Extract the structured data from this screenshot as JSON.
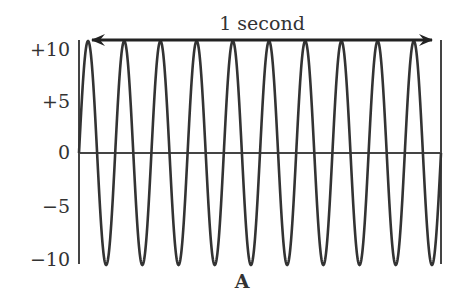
{
  "chart_data": {
    "type": "line",
    "title": "",
    "annotation": "1 second",
    "panel_label": "A",
    "xlabel": "",
    "ylabel": "",
    "yticks": [
      "+10",
      "+5",
      "0",
      "−5",
      "−10"
    ],
    "ytick_values": [
      10,
      5,
      0,
      -5,
      -10
    ],
    "ylim": [
      -10,
      10
    ],
    "xlim": [
      0,
      1
    ],
    "grid": false,
    "legend": null,
    "series": [
      {
        "name": "sine wave",
        "function": "10*sin(2*pi*10*t)",
        "amplitude": 10,
        "frequency_hz": 10,
        "cycles": 10,
        "duration_s": 1
      }
    ],
    "colors": {
      "line": "#333333",
      "axis": "#444444",
      "arrow": "#222222"
    }
  },
  "labels": {
    "y_pos10": "+10",
    "y_pos5": "+5",
    "y_zero": "0",
    "y_neg5": "−5",
    "y_neg10": "−10",
    "arrow_caption": "1 second",
    "panel": "A"
  }
}
